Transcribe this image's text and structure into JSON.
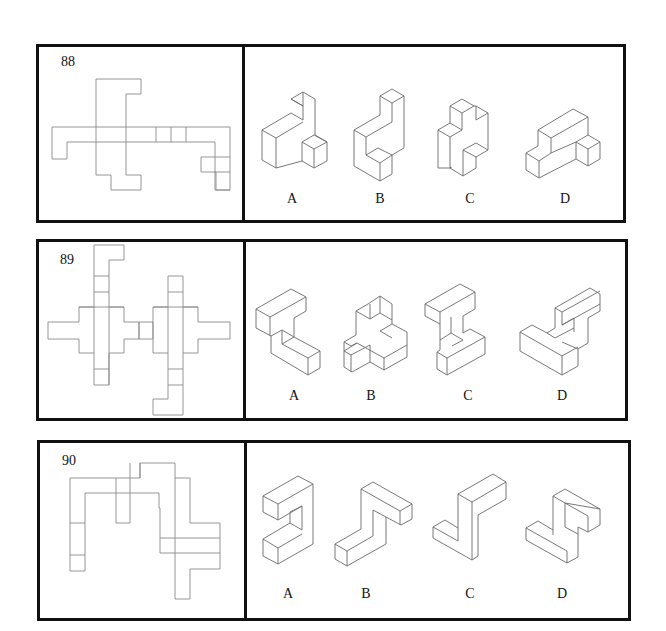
{
  "problems": [
    {
      "number": "88",
      "options": [
        {
          "label": "A"
        },
        {
          "label": "B"
        },
        {
          "label": "C"
        },
        {
          "label": "D"
        }
      ]
    },
    {
      "number": "89",
      "options": [
        {
          "label": "A"
        },
        {
          "label": "B"
        },
        {
          "label": "C"
        },
        {
          "label": "D"
        }
      ]
    },
    {
      "number": "90",
      "options": [
        {
          "label": "A"
        },
        {
          "label": "B"
        },
        {
          "label": "C"
        },
        {
          "label": "D"
        }
      ]
    }
  ],
  "colors": {
    "frame": "#111111",
    "net_line": "#8a8a8a",
    "solid_line": "#6a6a6a",
    "background": "#ffffff"
  }
}
